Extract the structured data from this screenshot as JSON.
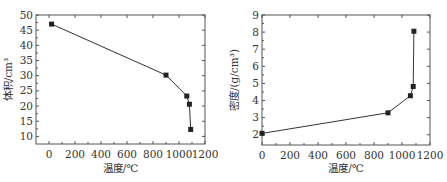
{
  "chart_data": [
    {
      "type": "line",
      "title": "",
      "xlabel": "温度/℃",
      "ylabel": "体积/cm³",
      "xlim": [
        -100,
        1200
      ],
      "ylim": [
        7.5,
        50
      ],
      "x_ticks": [
        0,
        200,
        400,
        600,
        800,
        1000,
        1200
      ],
      "y_ticks": [
        10,
        15,
        20,
        25,
        30,
        35,
        40,
        45,
        50
      ],
      "grid": false,
      "legend": "none",
      "series": [
        {
          "name": "体积",
          "marker": "square",
          "x": [
            20,
            900,
            1060,
            1080,
            1090
          ],
          "y": [
            47.0,
            30.2,
            23.3,
            20.6,
            12.3
          ]
        }
      ]
    },
    {
      "type": "line",
      "title": "",
      "xlabel": "温度/℃",
      "ylabel": "密度/(g/cm³)",
      "xlim": [
        0,
        1200
      ],
      "ylim": [
        1.4,
        9
      ],
      "x_ticks": [
        0,
        200,
        400,
        600,
        800,
        1000,
        1200
      ],
      "y_ticks": [
        2,
        3,
        4,
        5,
        6,
        7,
        8,
        9
      ],
      "grid": false,
      "legend": "none",
      "series": [
        {
          "name": "密度",
          "marker": "square",
          "x": [
            0,
            900,
            1060,
            1080,
            1085
          ],
          "y": [
            2.08,
            3.28,
            4.28,
            4.82,
            8.05
          ]
        }
      ]
    }
  ]
}
